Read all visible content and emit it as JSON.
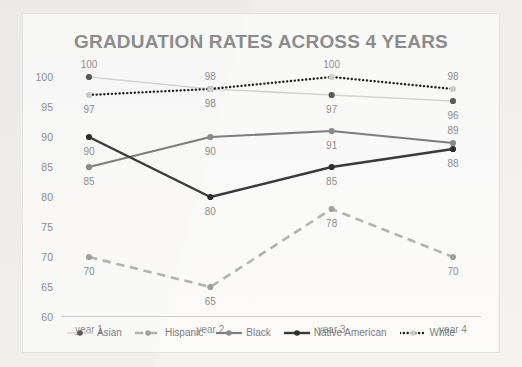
{
  "chart_data": {
    "type": "line",
    "title": "GRADUATION RATES ACROSS 4 YEARS",
    "xlabel": "",
    "ylabel": "",
    "categories": [
      "year 1",
      "year 2",
      "year 3",
      "year 4"
    ],
    "ylim": [
      60,
      100
    ],
    "yticks": [
      60,
      65,
      70,
      75,
      80,
      85,
      90,
      95,
      100
    ],
    "grid": false,
    "legend_position": "bottom",
    "data_labels": true,
    "series": [
      {
        "name": "Asian",
        "values": [
          100,
          98,
          97,
          96
        ],
        "color": "#d4d4d4",
        "marker_color": "#5a5a5a",
        "style": "solid",
        "width": 1.6
      },
      {
        "name": "Hispanic",
        "values": [
          70,
          65,
          78,
          70
        ],
        "color": "#b2b2b2",
        "marker_color": "#a0a0a0",
        "style": "dashed",
        "width": 2.6
      },
      {
        "name": "Black",
        "values": [
          85,
          90,
          91,
          89
        ],
        "color": "#7d7d7d",
        "marker_color": "#8a8a8a",
        "style": "solid",
        "width": 2.2
      },
      {
        "name": "Native American",
        "values": [
          90,
          80,
          85,
          88
        ],
        "color": "#3a3a3a",
        "marker_color": "#2e2e2e",
        "style": "solid",
        "width": 2.4
      },
      {
        "name": "White",
        "values": [
          97,
          98,
          100,
          98
        ],
        "color": "#1f1f1f",
        "marker_color": "#cccccc",
        "style": "dotted",
        "width": 2.4
      }
    ],
    "point_labels": [
      {
        "series": "Asian",
        "category": "year 1",
        "text": "100",
        "pos": "above"
      },
      {
        "series": "Asian",
        "category": "year 2",
        "text": "98",
        "pos": "above"
      },
      {
        "series": "Asian",
        "category": "year 3",
        "text": "97",
        "pos": "below"
      },
      {
        "series": "Asian",
        "category": "year 4",
        "text": "96",
        "pos": "below"
      },
      {
        "series": "White",
        "category": "year 1",
        "text": "97",
        "pos": "below"
      },
      {
        "series": "White",
        "category": "year 2",
        "text": "98",
        "pos": "below"
      },
      {
        "series": "White",
        "category": "year 3",
        "text": "100",
        "pos": "above"
      },
      {
        "series": "White",
        "category": "year 4",
        "text": "98",
        "pos": "above"
      },
      {
        "series": "Black",
        "category": "year 1",
        "text": "85",
        "pos": "below"
      },
      {
        "series": "Black",
        "category": "year 2",
        "text": "90",
        "pos": "below"
      },
      {
        "series": "Black",
        "category": "year 3",
        "text": "91",
        "pos": "below"
      },
      {
        "series": "Black",
        "category": "year 4",
        "text": "89",
        "pos": "above"
      },
      {
        "series": "Native American",
        "category": "year 1",
        "text": "90",
        "pos": "below"
      },
      {
        "series": "Native American",
        "category": "year 2",
        "text": "80",
        "pos": "below"
      },
      {
        "series": "Native American",
        "category": "year 3",
        "text": "85",
        "pos": "below"
      },
      {
        "series": "Native American",
        "category": "year 4",
        "text": "88",
        "pos": "below"
      },
      {
        "series": "Hispanic",
        "category": "year 1",
        "text": "70",
        "pos": "below"
      },
      {
        "series": "Hispanic",
        "category": "year 2",
        "text": "65",
        "pos": "below"
      },
      {
        "series": "Hispanic",
        "category": "year 3",
        "text": "78",
        "pos": "below"
      },
      {
        "series": "Hispanic",
        "category": "year 4",
        "text": "70",
        "pos": "below"
      }
    ],
    "colors": {
      "title": "#8c8c8c",
      "tick": "#8d8d8d",
      "axis": "#cfcfcf",
      "background": "#f2f2f0",
      "card": "#ffffff"
    }
  }
}
